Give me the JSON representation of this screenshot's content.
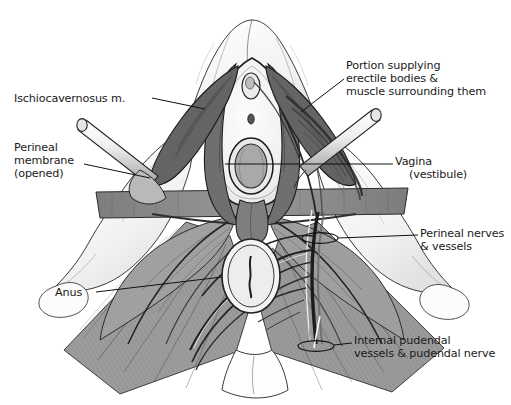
{
  "figure": {
    "background_color": "#ffffff",
    "ink_color": "#1a1a1a",
    "muscle_fill_color": "#9a9a9a",
    "membrane_fill_color": "#8f8f8f",
    "bone_fill_color": "#fbfbfb",
    "leader_line_color": "#111111"
  },
  "labels": {
    "ischiocavernosus": {
      "lines": [
        "Ischiocavernosus m."
      ],
      "side": "left",
      "leader_from": [
        152,
        98
      ],
      "leader_to": [
        205,
        109
      ]
    },
    "perineal_membrane": {
      "lines": [
        "Perineal",
        "membrane",
        "(opened)"
      ],
      "side": "left",
      "leader_from": [
        84,
        164
      ],
      "leader_to": [
        150,
        178
      ]
    },
    "anus": {
      "lines": [
        "Anus"
      ],
      "side": "left",
      "leader_from": [
        96,
        292
      ],
      "leader_to": [
        222,
        277
      ]
    },
    "portion_supplying": {
      "lines": [
        "Portion supplying",
        "erectile bodies &",
        "muscle surrounding them"
      ],
      "side": "right",
      "leader_from": [
        344,
        79
      ],
      "leader_to": [
        301,
        112
      ]
    },
    "vagina": {
      "lines": [
        "Vagina",
        "(vestibule)"
      ],
      "side": "right",
      "leader_from": [
        393,
        164
      ],
      "leader_to": [
        225,
        164
      ]
    },
    "perineal_nerves": {
      "lines": [
        "Perineal nerves",
        "& vessels"
      ],
      "side": "right",
      "leader_from": [
        418,
        235
      ],
      "leader_to": [
        320,
        238
      ]
    },
    "internal_pudendal": {
      "lines": [
        "Internal pudendal",
        "vessels & pudendal nerve"
      ],
      "side": "right",
      "leader_from": [
        352,
        343
      ],
      "leader_to": [
        318,
        345
      ]
    }
  },
  "structures": [
    {
      "name": "pubic-symphysis-region",
      "kind": "bone"
    },
    {
      "name": "ischiopubic-ramus-left",
      "kind": "bone"
    },
    {
      "name": "ischiopubic-ramus-right",
      "kind": "bone"
    },
    {
      "name": "ischial-tuberosity-left",
      "kind": "bone"
    },
    {
      "name": "ischial-tuberosity-right",
      "kind": "bone"
    },
    {
      "name": "coccyx",
      "kind": "bone"
    },
    {
      "name": "vestibule",
      "kind": "mucosa"
    },
    {
      "name": "vaginal-orifice",
      "kind": "orifice"
    },
    {
      "name": "urethral-orifice",
      "kind": "orifice"
    },
    {
      "name": "clitoris",
      "kind": "erectile"
    },
    {
      "name": "anus",
      "kind": "orifice"
    },
    {
      "name": "perineal-body",
      "kind": "fibromuscular"
    },
    {
      "name": "perineal-membrane",
      "kind": "membrane"
    },
    {
      "name": "ischiocavernosus-muscle-left",
      "kind": "muscle"
    },
    {
      "name": "ischiocavernosus-muscle-right",
      "kind": "muscle"
    },
    {
      "name": "bulbospongiosus-muscle",
      "kind": "muscle"
    },
    {
      "name": "superficial-transverse-perineal-muscle",
      "kind": "muscle"
    },
    {
      "name": "external-anal-sphincter",
      "kind": "muscle"
    },
    {
      "name": "levator-ani-left",
      "kind": "muscle"
    },
    {
      "name": "levator-ani-right",
      "kind": "muscle"
    },
    {
      "name": "gluteus-maximus-left",
      "kind": "muscle"
    },
    {
      "name": "gluteus-maximus-right",
      "kind": "muscle"
    },
    {
      "name": "pudendal-nerve-trunk",
      "kind": "nerve"
    },
    {
      "name": "perineal-nerve-branches",
      "kind": "nerve"
    },
    {
      "name": "inferior-rectal-nerves",
      "kind": "nerve"
    },
    {
      "name": "dorsal-nerve-of-clitoris",
      "kind": "nerve"
    },
    {
      "name": "internal-pudendal-artery",
      "kind": "vessel"
    },
    {
      "name": "surgical-probe-left",
      "kind": "instrument"
    },
    {
      "name": "surgical-probe-right",
      "kind": "instrument"
    }
  ]
}
